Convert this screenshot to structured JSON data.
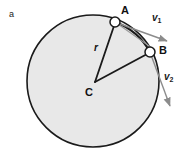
{
  "figure": {
    "panel_letter": "a",
    "background_color": "#ffffff",
    "disc": {
      "name": "rotating-disc",
      "center_x": 93,
      "center_y": 81,
      "radius": 66,
      "fill_color": "#e8e8e8",
      "stroke_color": "#1a1a1a",
      "stroke_width": 1.6
    },
    "points": [
      {
        "id": "A",
        "label": "A",
        "x": 115,
        "y": 22,
        "marker_radius": 5,
        "fill_color": "#ffffff",
        "stroke_color": "#1a1a1a",
        "label_x": 121,
        "label_y": 5
      },
      {
        "id": "B",
        "label": "B",
        "x": 150,
        "y": 52,
        "marker_radius": 5,
        "fill_color": "#ffffff",
        "stroke_color": "#1a1a1a",
        "label_x": 159,
        "label_y": 45
      },
      {
        "id": "C",
        "label": "C",
        "x": 95,
        "y": 82,
        "marker_radius": 0,
        "fill_color": "#1a1a1a",
        "stroke_color": "#1a1a1a",
        "label_x": 85,
        "label_y": 87
      }
    ],
    "radius_line": {
      "label": "r",
      "label_x": 94,
      "label_y": 43,
      "from": "C",
      "to": "A",
      "stroke_color": "#1a1a1a",
      "stroke_width": 1.8
    },
    "chord": {
      "name": "chord-a-to-b",
      "from": "C",
      "to": "B",
      "stroke_color": "#1a1a1a",
      "stroke_width": 1.8
    },
    "arc_ab": {
      "name": "arc-a-to-b",
      "stroke_color": "#1a1a1a",
      "stroke_width": 2.2
    },
    "vectors": [
      {
        "id": "v1",
        "label": "v",
        "subscript": "1",
        "origin_x": 115,
        "origin_y": 22,
        "tip_x": 168,
        "tip_y": 41,
        "label_x": 152,
        "label_y": 13,
        "stroke_color": "#8c8c8c",
        "stroke_width": 1.4
      },
      {
        "id": "v2",
        "label": "v",
        "subscript": "2",
        "origin_x": 150,
        "origin_y": 52,
        "tip_x": 171,
        "tip_y": 108,
        "label_x": 164,
        "label_y": 72,
        "stroke_color": "#8c8c8c",
        "stroke_width": 1.4
      }
    ],
    "guide_lines": [
      {
        "name": "guide-a-to-b",
        "x1": 115,
        "y1": 22,
        "x2": 152,
        "y2": 48,
        "stroke_color": "#9a9a9a",
        "stroke_width": 1.1
      }
    ]
  }
}
